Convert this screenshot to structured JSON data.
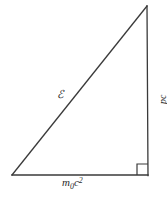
{
  "figure": {
    "type": "geometry-diagram",
    "background_color": "#ffffff",
    "stroke_color": "#3a3a3a",
    "stroke_width": 1.3,
    "width": 167,
    "height": 200
  },
  "triangle": {
    "vertices": {
      "bottom_left": {
        "x": 12,
        "y": 175
      },
      "bottom_right": {
        "x": 148,
        "y": 175
      },
      "top_right": {
        "x": 147,
        "y": 6
      }
    },
    "right_angle": {
      "at_vertex": "bottom_right",
      "marker_size": 11,
      "marker_x": 137,
      "marker_y": 164
    }
  },
  "labels": {
    "hypotenuse": {
      "text": "ℰ",
      "meaning": "total energy",
      "x": 57,
      "y": 89
    },
    "vertical_side": {
      "text": "pc",
      "meaning": "momentum times speed of light",
      "rotation_deg": -90,
      "x": 149,
      "y": 86
    },
    "base_side": {
      "base": "m",
      "subscript": "0",
      "factor": "c",
      "superscript": "2",
      "text": "m₀c²",
      "meaning": "rest energy",
      "x": 62,
      "y": 177
    }
  }
}
